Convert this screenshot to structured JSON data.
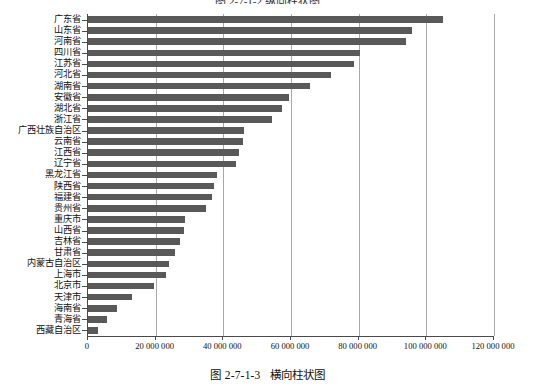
{
  "figure": {
    "top_title_sliver": "图 2-7-1-2  纵向柱状图",
    "caption_number": "图 2-7-1-3",
    "caption_text": "横向柱状图"
  },
  "chart_data": {
    "type": "bar",
    "orientation": "horizontal",
    "title": "",
    "xlabel": "",
    "ylabel": "",
    "xlim": [
      0,
      120000000
    ],
    "grid": true,
    "legend": false,
    "bar_color": "#595959",
    "axis_color": "#4a4a4a",
    "gridline_color": "#a9a9a9",
    "xticks": [
      0,
      20000000,
      40000000,
      60000000,
      80000000,
      100000000,
      120000000
    ],
    "xticklabels": [
      "0",
      "20 000 000",
      "40 000 000",
      "60 000 000",
      "80 000 000",
      "100 000 000",
      "120 000 000"
    ],
    "categories": [
      "广东省",
      "山东省",
      "河南省",
      "四川省",
      "江苏省",
      "河北省",
      "湖南省",
      "安徽省",
      "湖北省",
      "浙江省",
      "广西壮族自治区",
      "云南省",
      "江西省",
      "辽宁省",
      "黑龙江省",
      "陕西省",
      "福建省",
      "贵州省",
      "重庆市",
      "山西省",
      "吉林省",
      "甘肃省",
      "内蒙古自治区",
      "上海市",
      "北京市",
      "天津市",
      "海南省",
      "青海省",
      "西藏自治区"
    ],
    "values": [
      105000000,
      95800000,
      94000000,
      80400000,
      78600000,
      71900000,
      65700000,
      59500000,
      57200000,
      54400000,
      46000000,
      45900000,
      44500000,
      43700000,
      38200000,
      37300000,
      36600000,
      35000000,
      28800000,
      28400000,
      27300000,
      25600000,
      24000000,
      23000000,
      19600000,
      12900000,
      8700000,
      5600000,
      3000000
    ]
  }
}
